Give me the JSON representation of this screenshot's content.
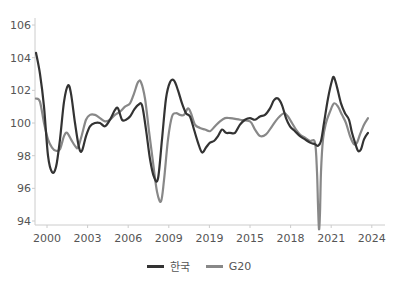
{
  "chart_data": {
    "type": "line",
    "title": "",
    "xlabel": "",
    "ylabel": "",
    "ylim": [
      94,
      106
    ],
    "yticks": [
      94,
      96,
      98,
      100,
      102,
      104,
      106
    ],
    "xtick_labels": [
      "2000",
      "2003",
      "2006",
      "2009",
      "2019",
      "2015",
      "2018",
      "2021",
      "2024"
    ],
    "grid": false,
    "legend_position": "bottom",
    "series": [
      {
        "name": "한국",
        "color": "#333333",
        "points": [
          [
            36,
            104.3
          ],
          [
            40,
            103.0
          ],
          [
            44,
            101.0
          ],
          [
            48,
            98.0
          ],
          [
            52,
            97.0
          ],
          [
            56,
            97.3
          ],
          [
            60,
            99.0
          ],
          [
            64,
            101.3
          ],
          [
            68,
            102.3
          ],
          [
            71,
            101.8
          ],
          [
            75,
            100.0
          ],
          [
            79,
            98.5
          ],
          [
            82,
            98.3
          ],
          [
            86,
            99.2
          ],
          [
            90,
            99.8
          ],
          [
            95,
            100.0
          ],
          [
            100,
            100.0
          ],
          [
            105,
            99.8
          ],
          [
            110,
            100.2
          ],
          [
            115,
            100.8
          ],
          [
            118,
            100.9
          ],
          [
            122,
            100.2
          ],
          [
            126,
            100.2
          ],
          [
            130,
            100.4
          ],
          [
            134,
            100.8
          ],
          [
            138,
            101.1
          ],
          [
            142,
            101.1
          ],
          [
            146,
            99.6
          ],
          [
            150,
            97.8
          ],
          [
            154,
            96.7
          ],
          [
            158,
            96.6
          ],
          [
            162,
            99.0
          ],
          [
            166,
            101.5
          ],
          [
            170,
            102.5
          ],
          [
            174,
            102.6
          ],
          [
            178,
            102.0
          ],
          [
            182,
            101.2
          ],
          [
            186,
            100.6
          ],
          [
            190,
            100.4
          ],
          [
            194,
            99.6
          ],
          [
            198,
            98.8
          ],
          [
            202,
            98.2
          ],
          [
            206,
            98.5
          ],
          [
            210,
            98.8
          ],
          [
            214,
            98.9
          ],
          [
            218,
            99.2
          ],
          [
            222,
            99.6
          ],
          [
            226,
            99.4
          ],
          [
            230,
            99.4
          ],
          [
            235,
            99.4
          ],
          [
            240,
            99.9
          ],
          [
            245,
            100.2
          ],
          [
            250,
            100.3
          ],
          [
            255,
            100.2
          ],
          [
            260,
            100.4
          ],
          [
            265,
            100.5
          ],
          [
            270,
            100.9
          ],
          [
            274,
            101.4
          ],
          [
            278,
            101.5
          ],
          [
            282,
            101.1
          ],
          [
            286,
            100.3
          ],
          [
            290,
            99.8
          ],
          [
            295,
            99.5
          ],
          [
            300,
            99.2
          ],
          [
            305,
            99.0
          ],
          [
            310,
            98.8
          ],
          [
            315,
            98.7
          ],
          [
            318,
            98.6
          ],
          [
            321,
            98.9
          ],
          [
            324,
            100.0
          ],
          [
            328,
            101.5
          ],
          [
            332,
            102.6
          ],
          [
            334,
            102.8
          ],
          [
            337,
            102.2
          ],
          [
            341,
            101.2
          ],
          [
            345,
            100.6
          ],
          [
            349,
            100.2
          ],
          [
            352,
            99.4
          ],
          [
            355,
            98.8
          ],
          [
            358,
            98.3
          ],
          [
            361,
            98.4
          ],
          [
            364,
            99.0
          ],
          [
            368,
            99.4
          ]
        ]
      },
      {
        "name": "G20",
        "color": "#888888",
        "points": [
          [
            36,
            101.5
          ],
          [
            40,
            101.3
          ],
          [
            44,
            100.0
          ],
          [
            48,
            99.0
          ],
          [
            52,
            98.5
          ],
          [
            56,
            98.3
          ],
          [
            60,
            98.4
          ],
          [
            64,
            99.2
          ],
          [
            67,
            99.4
          ],
          [
            71,
            99.0
          ],
          [
            75,
            98.6
          ],
          [
            78,
            98.5
          ],
          [
            82,
            99.3
          ],
          [
            86,
            100.2
          ],
          [
            90,
            100.5
          ],
          [
            95,
            100.5
          ],
          [
            100,
            100.3
          ],
          [
            105,
            100.1
          ],
          [
            110,
            100.2
          ],
          [
            115,
            100.5
          ],
          [
            120,
            100.7
          ],
          [
            125,
            101.0
          ],
          [
            130,
            101.2
          ],
          [
            134,
            101.8
          ],
          [
            138,
            102.5
          ],
          [
            141,
            102.5
          ],
          [
            145,
            101.5
          ],
          [
            149,
            99.5
          ],
          [
            153,
            97.6
          ],
          [
            157,
            95.8
          ],
          [
            161,
            95.2
          ],
          [
            164,
            96.5
          ],
          [
            168,
            99.0
          ],
          [
            172,
            100.4
          ],
          [
            176,
            100.6
          ],
          [
            180,
            100.5
          ],
          [
            184,
            100.5
          ],
          [
            188,
            100.9
          ],
          [
            191,
            100.6
          ],
          [
            195,
            99.9
          ],
          [
            200,
            99.7
          ],
          [
            205,
            99.6
          ],
          [
            210,
            99.5
          ],
          [
            215,
            99.8
          ],
          [
            220,
            100.1
          ],
          [
            225,
            100.3
          ],
          [
            230,
            100.3
          ],
          [
            240,
            100.2
          ],
          [
            250,
            100.1
          ],
          [
            255,
            99.6
          ],
          [
            260,
            99.2
          ],
          [
            266,
            99.3
          ],
          [
            272,
            99.8
          ],
          [
            278,
            100.3
          ],
          [
            284,
            100.6
          ],
          [
            288,
            100.4
          ],
          [
            292,
            100.0
          ],
          [
            296,
            99.6
          ],
          [
            300,
            99.3
          ],
          [
            305,
            99.1
          ],
          [
            310,
            98.9
          ],
          [
            315,
            98.8
          ],
          [
            317,
            97.0
          ],
          [
            318,
            95.0
          ],
          [
            319,
            93.5
          ],
          [
            320,
            94.5
          ],
          [
            321,
            97.0
          ],
          [
            323,
            99.0
          ],
          [
            326,
            100.0
          ],
          [
            330,
            100.7
          ],
          [
            334,
            101.2
          ],
          [
            338,
            101.0
          ],
          [
            342,
            100.5
          ],
          [
            346,
            100.0
          ],
          [
            350,
            99.2
          ],
          [
            354,
            98.7
          ],
          [
            357,
            98.8
          ],
          [
            360,
            99.3
          ],
          [
            364,
            99.9
          ],
          [
            368,
            100.3
          ]
        ]
      }
    ]
  },
  "legend": {
    "items": [
      {
        "label": "한국",
        "color": "#333333"
      },
      {
        "label": "G20",
        "color": "#888888"
      }
    ]
  }
}
